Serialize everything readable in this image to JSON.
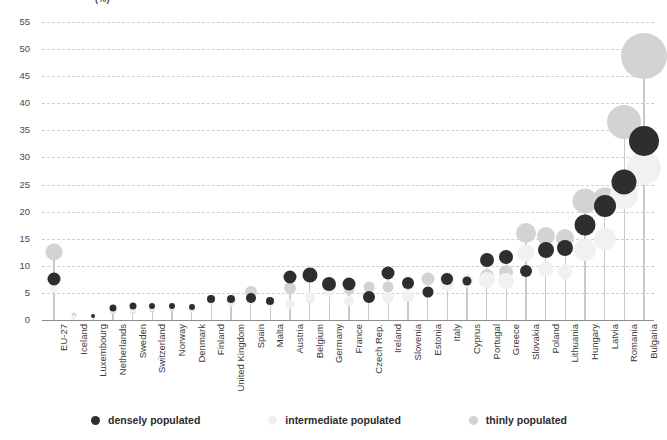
{
  "chart_data": {
    "type": "scatter",
    "title": "(%)",
    "xlabel": "",
    "ylabel": "",
    "ylim": [
      0,
      55
    ],
    "ytick_step": 5,
    "yticks": [
      0,
      5,
      10,
      15,
      20,
      25,
      30,
      35,
      40,
      45,
      50,
      55
    ],
    "grid": true,
    "legend_position": "bottom",
    "categories": [
      "EU-27",
      "Iceland",
      "Luxembourg",
      "Netherlands",
      "Sweden",
      "Switzerland",
      "Norway",
      "Denmark",
      "Finland",
      "United Kingdom",
      "Spain",
      "Malta",
      "Austria",
      "Belgium",
      "Germany",
      "France",
      "Czech Rep.",
      "Ireland",
      "Slovenia",
      "Estonia",
      "Italy",
      "Cyprus",
      "Portugal",
      "Greece",
      "Slovakia",
      "Poland",
      "Lithuania",
      "Hungary",
      "Latvia",
      "Romania",
      "Bulgaria"
    ],
    "series": [
      {
        "name": "densely populated",
        "color": "#2e2e2e",
        "values": [
          7.5,
          null,
          0.8,
          2.2,
          2.6,
          2.6,
          2.6,
          2.4,
          3.9,
          3.9,
          4.0,
          3.6,
          8.0,
          8.4,
          6.7,
          6.6,
          4.2,
          8.6,
          6.9,
          5.1,
          7.6,
          7.2,
          11.0,
          11.6,
          9.0,
          13.0,
          13.2,
          17.6,
          21.0,
          25.5,
          33.0
        ]
      },
      {
        "name": "intermediate populated",
        "color": "#f1f1f1",
        "values": [
          6.0,
          0.6,
          0.9,
          1.9,
          1.9,
          2.3,
          2.4,
          2.0,
          3.8,
          3.3,
          3.9,
          3.4,
          3.0,
          4.2,
          5.5,
          3.6,
          4.3,
          4.1,
          4.5,
          5.1,
          6.6,
          7.2,
          7.3,
          7.2,
          12.3,
          9.4,
          8.8,
          13.0,
          15.0,
          23.0,
          28.0
        ]
      },
      {
        "name": "thinly populated",
        "color": "#d3d3d3",
        "values": [
          12.5,
          1.0,
          null,
          1.6,
          1.7,
          2.1,
          2.2,
          2.1,
          3.9,
          3.5,
          5.2,
          null,
          5.9,
          4.0,
          5.9,
          5.7,
          6.1,
          6.1,
          6.6,
          7.6,
          7.6,
          null,
          8.1,
          8.8,
          16.0,
          15.5,
          15.2,
          22.0,
          22.2,
          36.5,
          48.8
        ]
      }
    ],
    "bubble_sizes": {
      "densely populated": [
        13,
        0,
        4,
        7,
        7,
        6,
        6,
        6,
        8,
        8,
        10,
        8,
        13,
        15,
        14,
        13,
        12,
        13,
        12,
        11,
        12,
        9,
        14,
        14,
        12,
        16,
        16,
        21,
        22,
        25,
        30
      ],
      "intermediate populated": [
        9,
        4,
        4,
        6,
        6,
        6,
        6,
        6,
        9,
        9,
        11,
        9,
        10,
        10,
        13,
        10,
        11,
        11,
        12,
        13,
        14,
        13,
        16,
        16,
        17,
        15,
        15,
        22,
        22,
        28,
        34
      ],
      "thinly populated": [
        17,
        5,
        0,
        6,
        6,
        6,
        6,
        6,
        8,
        9,
        12,
        0,
        12,
        9,
        11,
        11,
        11,
        11,
        12,
        13,
        13,
        0,
        14,
        14,
        20,
        18,
        18,
        25,
        25,
        34,
        46
      ]
    }
  },
  "legend": {
    "items": [
      {
        "label": "densely populated",
        "color": "#2e2e2e"
      },
      {
        "label": "intermediate populated",
        "color": "#f1f1f1"
      },
      {
        "label": "thinly populated",
        "color": "#d3d3d3"
      }
    ]
  }
}
